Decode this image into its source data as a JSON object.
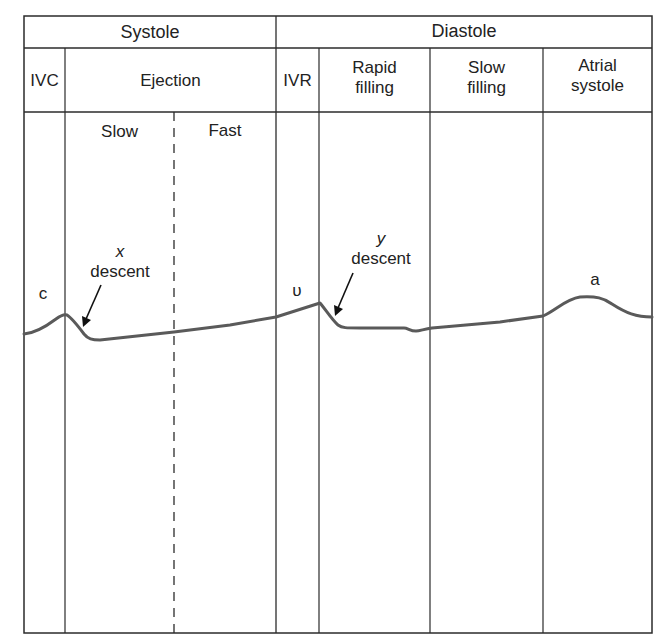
{
  "header": {
    "systole": "Systole",
    "diastole": "Diastole"
  },
  "phases": {
    "ivc": "IVC",
    "ejection": "Ejection",
    "ivr": "IVR",
    "rapid_filling_1": "Rapid",
    "rapid_filling_2": "filling",
    "slow_filling_1": "Slow",
    "slow_filling_2": "filling",
    "atrial_systole_1": "Atrial",
    "atrial_systole_2": "systole"
  },
  "ejection_subphases": {
    "slow": "Slow",
    "fast": "Fast"
  },
  "waves": {
    "c": "c",
    "v": "υ",
    "a": "a"
  },
  "annotations": {
    "x_descent_letter": "x",
    "x_descent_word": "descent",
    "y_descent_letter": "y",
    "y_descent_word": "descent"
  },
  "colors": {
    "grid": "#2b2b2b",
    "waveform": "#5a5a5a",
    "text": "#222222"
  }
}
